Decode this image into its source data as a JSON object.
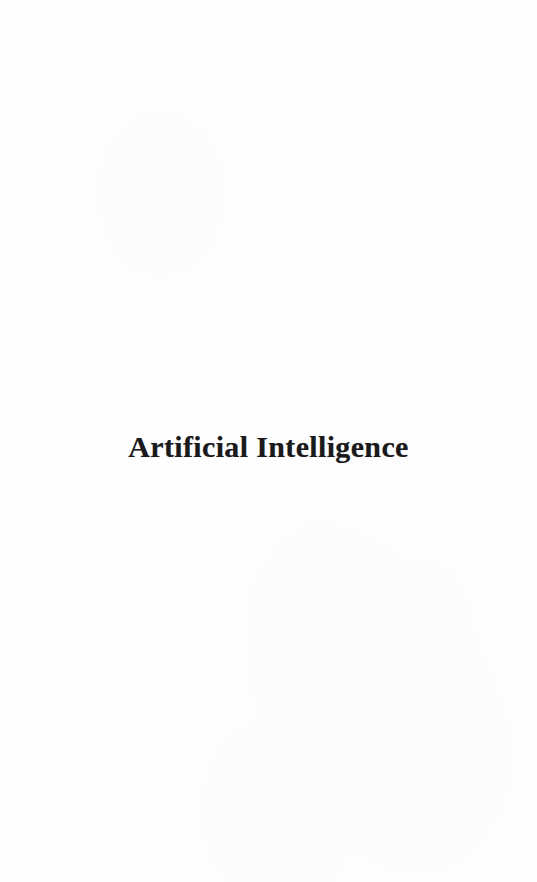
{
  "document": {
    "page_type": "section-divider-page",
    "background_color": "#fefefe",
    "ink_color": "#1a1a1c"
  },
  "page": {
    "heading": "Artificial Intelligence"
  }
}
